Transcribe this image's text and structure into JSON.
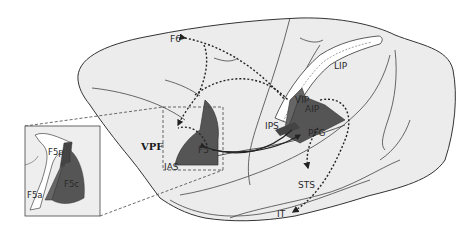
{
  "diagram": {
    "type": "brain-lateral-view",
    "labels": {
      "f6": "F6",
      "vpf": "VPF",
      "f5": "F5",
      "ias": "IAS",
      "ips": "IPS",
      "vip": "VIP",
      "aip": "AIP",
      "lip": "LIP",
      "pfg": "PFG",
      "sts": "STS",
      "it": "IT"
    },
    "inset": {
      "labels": {
        "f5p": "F5p",
        "f5c": "F5c",
        "f5a": "F5a"
      }
    },
    "colors": {
      "cortex_fill": "#ececec",
      "outline": "#333333",
      "area_dark": "#555555",
      "area_mid": "#707070",
      "sulcus_fill": "#ffffff",
      "inset_bg": "#eeeeee"
    }
  }
}
